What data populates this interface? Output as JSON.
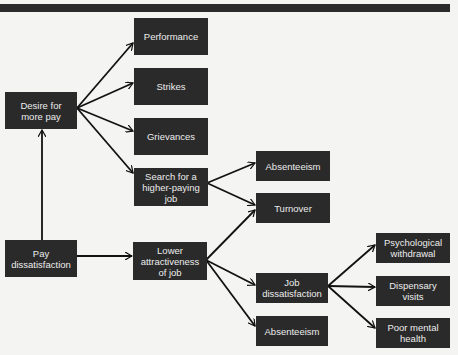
{
  "diagram": {
    "nodes": {
      "pay_dissatisfaction": "Pay\ndissatisfaction",
      "desire_more_pay": "Desire for\nmore pay",
      "performance": "Performance",
      "strikes": "Strikes",
      "grievances": "Grievances",
      "search_higher_paying_job": "Search for a\nhigher-paying\njob",
      "lower_attractiveness": "Lower\nattractiveness\nof job",
      "absenteeism_1": "Absenteeism",
      "turnover": "Turnover",
      "job_dissatisfaction": "Job\ndissatisfaction",
      "absenteeism_2": "Absenteeism",
      "psychological_withdrawal": "Psychological\nwithdrawal",
      "dispensary_visits": "Dispensary\nvisits",
      "poor_mental_health": "Poor mental\nhealth"
    },
    "edges": [
      [
        "Pay dissatisfaction",
        "Desire for more pay"
      ],
      [
        "Pay dissatisfaction",
        "Lower attractiveness of job"
      ],
      [
        "Desire for more pay",
        "Performance"
      ],
      [
        "Desire for more pay",
        "Strikes"
      ],
      [
        "Desire for more pay",
        "Grievances"
      ],
      [
        "Desire for more pay",
        "Search for a higher-paying job"
      ],
      [
        "Search for a higher-paying job",
        "Absenteeism"
      ],
      [
        "Search for a higher-paying job",
        "Turnover"
      ],
      [
        "Lower attractiveness of job",
        "Turnover"
      ],
      [
        "Lower attractiveness of job",
        "Job dissatisfaction"
      ],
      [
        "Lower attractiveness of job",
        "Absenteeism"
      ],
      [
        "Job dissatisfaction",
        "Psychological withdrawal"
      ],
      [
        "Job dissatisfaction",
        "Dispensary visits"
      ],
      [
        "Job dissatisfaction",
        "Poor mental health"
      ]
    ],
    "colors": {
      "node_fill": "#2a2a2a",
      "node_text": "#ececec",
      "arrow": "#111111",
      "background": "#f4f4f2"
    }
  }
}
